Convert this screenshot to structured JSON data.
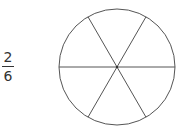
{
  "fraction": {
    "numerator": "2",
    "denominator": "6"
  },
  "circle": {
    "cx": 117,
    "cy": 67,
    "r": 58,
    "sections": 6,
    "stroke_color": "#555555",
    "fill_color": "#ffffff"
  }
}
